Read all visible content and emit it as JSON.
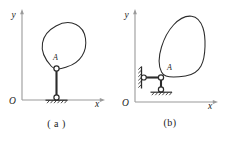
{
  "figure": {
    "kind": "statics-diagram",
    "background_color": "#ffffff",
    "line_color": "#2b2b2b",
    "axis_color": "#9a9a9a",
    "panels": [
      {
        "id": "a",
        "caption": "( a )",
        "axes": {
          "y_label": "y",
          "x_label": "x",
          "origin_label": "O"
        },
        "labels": {
          "point_a": "A"
        },
        "supports": [
          {
            "name": "pin-joint-a",
            "type": "pin",
            "label": "A"
          },
          {
            "name": "ground-pin-support",
            "type": "pin-on-ground"
          }
        ],
        "members": [
          {
            "name": "vertical-link",
            "type": "two-force-member"
          }
        ],
        "body": {
          "name": "rigid-body-outline",
          "type": "closed-curve"
        }
      },
      {
        "id": "b",
        "caption": "(b)",
        "axes": {
          "y_label": "y",
          "x_label": "x",
          "origin_label": "O"
        },
        "labels": {
          "point_a": "A"
        },
        "supports": [
          {
            "name": "pin-joint-a",
            "type": "pin",
            "label": "A"
          },
          {
            "name": "wall-pin-support",
            "type": "pin-on-wall"
          },
          {
            "name": "ground-pin-support",
            "type": "pin-on-ground"
          }
        ],
        "members": [
          {
            "name": "horizontal-link",
            "type": "two-force-member"
          },
          {
            "name": "vertical-link",
            "type": "two-force-member"
          }
        ],
        "body": {
          "name": "rigid-body-outline",
          "type": "closed-curve"
        }
      }
    ]
  }
}
